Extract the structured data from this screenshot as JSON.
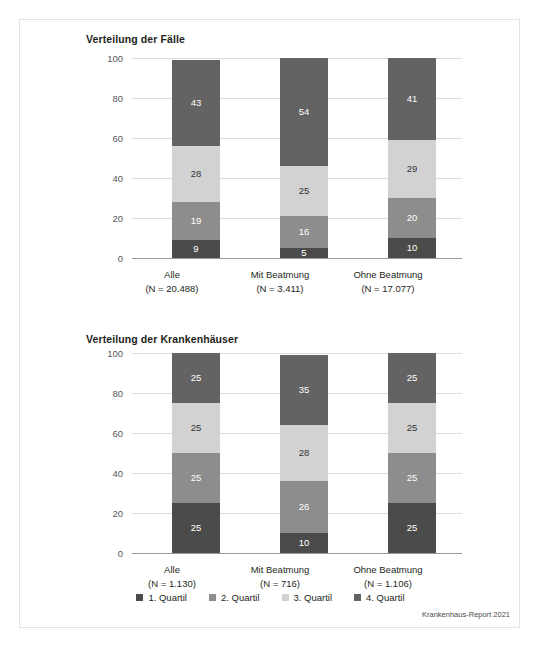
{
  "figure": {
    "footnote": "Krankenhaus-Report 2021",
    "palette": {
      "q1": "#4b4b4b",
      "q2": "#8d8d8d",
      "q3": "#d2d2d2",
      "q4": "#636363",
      "gridline": "#dcdcdc",
      "axis": "#9a9a9a",
      "frame": "#e3e3e3",
      "background": "#ffffff",
      "text": "#231f20"
    }
  },
  "legend": {
    "items": [
      {
        "label": "1. Quartil",
        "color": "#4b4b4b"
      },
      {
        "label": "2. Quartil",
        "color": "#8d8d8d"
      },
      {
        "label": "3. Quartil",
        "color": "#d2d2d2"
      },
      {
        "label": "4. Quartil",
        "color": "#636363"
      }
    ]
  },
  "chart_data": [
    {
      "type": "bar",
      "stacked": true,
      "title": "Verteilung der Fälle",
      "xlabel": "",
      "ylabel": "",
      "ylim": [
        0,
        100
      ],
      "yticks": [
        0,
        20,
        40,
        60,
        80,
        100
      ],
      "grid": true,
      "legend_position": "bottom",
      "categories": [
        "Alle",
        "Mit Beatmung",
        "Ohne Beatmung"
      ],
      "category_sublabels": [
        "(N = 20.488)",
        "(N = 3.411)",
        "(N = 17.077)"
      ],
      "series": [
        {
          "name": "1. Quartil",
          "values": [
            9,
            5,
            10
          ]
        },
        {
          "name": "2. Quartil",
          "values": [
            19,
            16,
            20
          ]
        },
        {
          "name": "3. Quartil",
          "values": [
            28,
            25,
            29
          ]
        },
        {
          "name": "4. Quartil",
          "values": [
            43,
            54,
            41
          ]
        }
      ]
    },
    {
      "type": "bar",
      "stacked": true,
      "title": "Verteilung der Krankenhäuser",
      "xlabel": "",
      "ylabel": "",
      "ylim": [
        0,
        100
      ],
      "yticks": [
        0,
        20,
        40,
        60,
        80,
        100
      ],
      "grid": true,
      "legend_position": "bottom",
      "categories": [
        "Alle",
        "Mit Beatmung",
        "Ohne Beatmung"
      ],
      "category_sublabels": [
        "(N = 1.130)",
        "(N = 716)",
        "(N = 1.106)"
      ],
      "series": [
        {
          "name": "1. Quartil",
          "values": [
            25,
            10,
            25
          ]
        },
        {
          "name": "2. Quartil",
          "values": [
            25,
            26,
            25
          ]
        },
        {
          "name": "3. Quartil",
          "values": [
            25,
            28,
            25
          ]
        },
        {
          "name": "4. Quartil",
          "values": [
            25,
            35,
            25
          ]
        }
      ]
    }
  ]
}
